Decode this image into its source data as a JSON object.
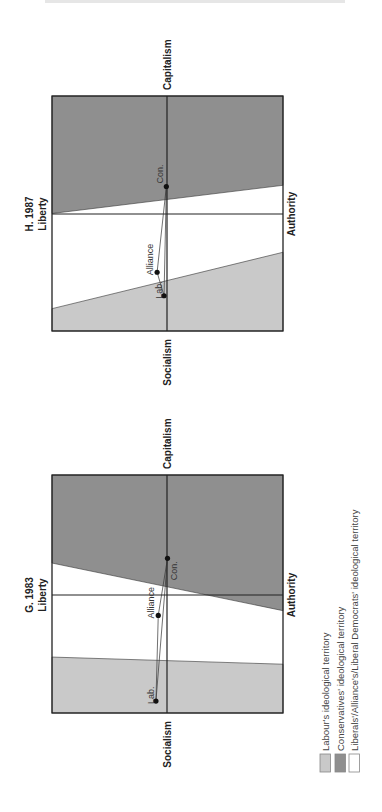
{
  "page": {
    "header_text": "HOW VOTERS CHOSE: THE IDEOLOGICAL TERRITORY"
  },
  "colors": {
    "labour": "#c9c9c9",
    "conservative": "#8f8f8f",
    "liberal": "#ffffff",
    "frame": "#222222",
    "dot": "#111111"
  },
  "legend": {
    "items": [
      {
        "label": "Labour's ideological territory",
        "swatch": "labour"
      },
      {
        "label": "Conservatives' ideological territory",
        "swatch": "conservative"
      },
      {
        "label": "Liberals'/Alliance's/Liberal Democrats' ideological territory",
        "swatch": "liberal"
      }
    ]
  },
  "chart_data": [
    {
      "type": "scatter",
      "title": "H. 1987",
      "axes": {
        "top": "Liberty",
        "bottom": "Authority",
        "left": "Socialism",
        "right": "Capitalism"
      },
      "xlabel": "Socialism — Capitalism",
      "ylabel": "Liberty — Authority",
      "xlim": [
        -1,
        1
      ],
      "ylim": [
        -1,
        1
      ],
      "grid": false,
      "legend_position": "below",
      "territories": {
        "conservative_boundary": {
          "at_liberty_edge": 0.0,
          "at_authority_edge": 0.24
        },
        "labour_boundary": {
          "at_liberty_edge": -0.81,
          "at_authority_edge": -0.33
        }
      },
      "points": [
        {
          "label": "Con.",
          "economic": 0.23,
          "liberty_authority": -0.01
        },
        {
          "label": "Alliance",
          "economic": -0.5,
          "liberty_authority": -0.09
        },
        {
          "label": "Lab.",
          "economic": -0.7,
          "liberty_authority": -0.03
        }
      ]
    },
    {
      "type": "scatter",
      "title": "G. 1983",
      "axes": {
        "top": "Liberty",
        "bottom": "Authority",
        "left": "Socialism",
        "right": "Capitalism"
      },
      "xlabel": "Socialism — Capitalism",
      "ylabel": "Liberty — Authority",
      "xlim": [
        -1,
        1
      ],
      "ylim": [
        -1,
        1
      ],
      "grid": false,
      "legend_position": "below",
      "territories": {
        "conservative_boundary": {
          "at_liberty_edge": 0.26,
          "at_authority_edge": -0.14
        },
        "labour_boundary": {
          "at_liberty_edge": -0.53,
          "at_authority_edge": -0.59
        }
      },
      "points": [
        {
          "label": "Con.",
          "economic": 0.3,
          "liberty_authority": 0.0
        },
        {
          "label": "Alliance",
          "economic": -0.18,
          "liberty_authority": -0.08
        },
        {
          "label": "Lab.",
          "economic": -0.9,
          "liberty_authority": -0.1
        }
      ]
    }
  ]
}
